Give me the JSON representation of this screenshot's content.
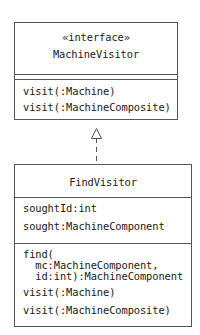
{
  "diagram": {
    "type": "UML class diagram",
    "interface_class": {
      "stereotype": "«interface»",
      "name": "MachineVisitor",
      "attributes": [],
      "operations": [
        "visit(:Machine)",
        "visit(:MachineComposite)"
      ]
    },
    "implementing_class": {
      "name": "FindVisitor",
      "attributes": [
        "soughtId:int",
        "sought:MachineComponent"
      ],
      "operations": [
        "find(",
        "  mc:MachineComponent,",
        "  id:int):MachineComponent",
        "visit(:Machine)",
        "visit(:MachineComposite)"
      ]
    },
    "relationship": {
      "kind": "realization",
      "from": "FindVisitor",
      "to": "MachineVisitor",
      "style": "dashed line with hollow triangle"
    },
    "colors": {
      "border": "#555555",
      "text": "#1a1a1a",
      "background": "#ffffff"
    }
  }
}
